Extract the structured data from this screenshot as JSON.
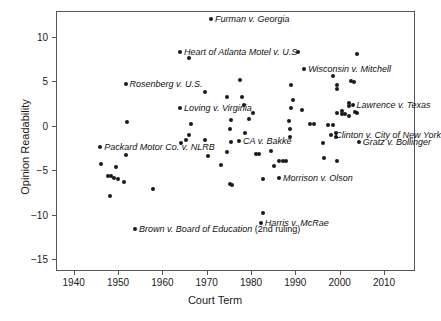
{
  "chart_data": {
    "type": "scatter",
    "title": "",
    "xlabel": "Court Term",
    "ylabel": "Opinion Readability",
    "xlim": [
      1936,
      2017
    ],
    "ylim": [
      -16.3,
      12.9
    ],
    "xticks": [
      1940,
      1950,
      1960,
      1970,
      1980,
      1990,
      2000,
      2010
    ],
    "xticklabels": [
      "1940",
      "1950",
      "1960",
      "1970",
      "1980",
      "1990",
      "2000",
      "2010"
    ],
    "yticks": [
      10,
      5,
      0,
      -5,
      -10,
      -15
    ],
    "yticklabels": [
      "10",
      "5",
      "0",
      "-5",
      "-10",
      "-15"
    ],
    "grid": false,
    "legend": null,
    "marker_color": "#1a1a1a",
    "frame_color": "#555555",
    "points": [
      {
        "x": 1971,
        "y": 12.0
      },
      {
        "x": 1964,
        "y": 8.3
      },
      {
        "x": 1966,
        "y": 7.6
      },
      {
        "x": 1990.5,
        "y": 8.3
      },
      {
        "x": 2004,
        "y": 8.1
      },
      {
        "x": 1992,
        "y": 6.4
      },
      {
        "x": 1951.7,
        "y": 4.75
      },
      {
        "x": 1977.5,
        "y": 5.15
      },
      {
        "x": 1998.6,
        "y": 5.6
      },
      {
        "x": 2002.5,
        "y": 5.0
      },
      {
        "x": 2003.2,
        "y": 4.95
      },
      {
        "x": 1999.3,
        "y": 4.6
      },
      {
        "x": 1999.3,
        "y": 4.2
      },
      {
        "x": 1989,
        "y": 4.6
      },
      {
        "x": 1969.5,
        "y": 3.8
      },
      {
        "x": 1974.5,
        "y": 3.2
      },
      {
        "x": 1978,
        "y": 3.3
      },
      {
        "x": 1989.5,
        "y": 2.9
      },
      {
        "x": 1964,
        "y": 2.05
      },
      {
        "x": 1978.3,
        "y": 2.35
      },
      {
        "x": 1989,
        "y": 2.0
      },
      {
        "x": 1991.5,
        "y": 1.8
      },
      {
        "x": 2002.2,
        "y": 2.55
      },
      {
        "x": 2002.2,
        "y": 2.25
      },
      {
        "x": 2002.9,
        "y": 2.4
      },
      {
        "x": 1980.5,
        "y": 1.5
      },
      {
        "x": 1979.5,
        "y": 0.75
      },
      {
        "x": 2000.5,
        "y": 1.7
      },
      {
        "x": 2000.5,
        "y": 1.35
      },
      {
        "x": 2001.3,
        "y": 1.35
      },
      {
        "x": 2002.0,
        "y": 1.15
      },
      {
        "x": 2003.4,
        "y": 1.6
      },
      {
        "x": 2003.8,
        "y": 1.45
      },
      {
        "x": 1999.3,
        "y": 1.4
      },
      {
        "x": 1975.5,
        "y": 0.7
      },
      {
        "x": 1988.5,
        "y": 0.6
      },
      {
        "x": 1952,
        "y": 0.45
      },
      {
        "x": 1966.5,
        "y": 0.2
      },
      {
        "x": 1993.3,
        "y": 0.2
      },
      {
        "x": 1994.2,
        "y": 0.25
      },
      {
        "x": 1997.3,
        "y": 0.05
      },
      {
        "x": 1998.6,
        "y": 0.05
      },
      {
        "x": 1975.3,
        "y": -0.3
      },
      {
        "x": 1988.8,
        "y": -0.4
      },
      {
        "x": 1978.6,
        "y": -0.85
      },
      {
        "x": 1966,
        "y": -1.05
      },
      {
        "x": 1999.2,
        "y": -0.85
      },
      {
        "x": 1999.2,
        "y": -1.2
      },
      {
        "x": 1998.1,
        "y": -1.05
      },
      {
        "x": 1988.7,
        "y": -1.25
      },
      {
        "x": 1946,
        "y": -2.35
      },
      {
        "x": 1964.2,
        "y": -1.9
      },
      {
        "x": 1965.3,
        "y": -1.6
      },
      {
        "x": 1969.6,
        "y": -1.55
      },
      {
        "x": 1977.3,
        "y": -1.65
      },
      {
        "x": 1975.5,
        "y": -1.85
      },
      {
        "x": 1996.2,
        "y": -1.95
      },
      {
        "x": 2004.3,
        "y": -1.85
      },
      {
        "x": 1951.8,
        "y": -3.3
      },
      {
        "x": 1970.2,
        "y": -3.4
      },
      {
        "x": 1974.5,
        "y": -2.95
      },
      {
        "x": 1981.2,
        "y": -3.15
      },
      {
        "x": 1981.8,
        "y": -3.2
      },
      {
        "x": 1984.5,
        "y": -2.85
      },
      {
        "x": 1996.4,
        "y": -3.6
      },
      {
        "x": 1999.3,
        "y": -3.9
      },
      {
        "x": 1946.2,
        "y": -4.3
      },
      {
        "x": 1949.6,
        "y": -4.6
      },
      {
        "x": 1973.2,
        "y": -4.4
      },
      {
        "x": 1985.2,
        "y": -4.45
      },
      {
        "x": 1986.4,
        "y": -3.95
      },
      {
        "x": 1987.3,
        "y": -3.9
      },
      {
        "x": 1987.8,
        "y": -3.95
      },
      {
        "x": 1947.8,
        "y": -5.6
      },
      {
        "x": 1948.3,
        "y": -5.6
      },
      {
        "x": 1949.1,
        "y": -5.9
      },
      {
        "x": 1950.0,
        "y": -5.95
      },
      {
        "x": 1951.3,
        "y": -6.35
      },
      {
        "x": 1957.8,
        "y": -7.05
      },
      {
        "x": 1948.1,
        "y": -7.85
      },
      {
        "x": 1975.2,
        "y": -6.55
      },
      {
        "x": 1975.8,
        "y": -6.6
      },
      {
        "x": 1982.8,
        "y": -6.0
      },
      {
        "x": 1986.3,
        "y": -5.9
      },
      {
        "x": 1982.7,
        "y": -9.75
      },
      {
        "x": 1982.2,
        "y": -10.85
      },
      {
        "x": 1953.8,
        "y": -11.6
      }
    ],
    "annotations": [
      {
        "text": "Furman v. Georgia",
        "x": 1971,
        "y": 12.0,
        "align": "left"
      },
      {
        "text": "Heart of Atlanta Motel v. U.S",
        "x": 1964,
        "y": 8.3,
        "align": "left"
      },
      {
        "text": "Wisconsin v. Mitchell",
        "x": 1992,
        "y": 6.4,
        "align": "left"
      },
      {
        "text": "Rosenberg v. U.S.",
        "x": 1951.7,
        "y": 4.75,
        "align": "left"
      },
      {
        "text": "Lawrence v. Texas",
        "x": 2002.9,
        "y": 2.4,
        "align": "left"
      },
      {
        "text": "Loving v. Virginia",
        "x": 1964,
        "y": 2.05,
        "align": "left"
      },
      {
        "text": "Clinton v. City of New York",
        "x": 1998.1,
        "y": -1.05,
        "align": "left"
      },
      {
        "text": "CA v. Bakke",
        "x": 1977.3,
        "y": -1.65,
        "align": "left"
      },
      {
        "text": "Gratz v. Bollinger",
        "x": 2004.3,
        "y": -1.85,
        "align": "left"
      },
      {
        "text": "Packard Motor Co. v. NLRB",
        "x": 1946,
        "y": -2.35,
        "align": "left"
      },
      {
        "text": "Morrison v. Olson",
        "x": 1986.3,
        "y": -5.9,
        "align": "left"
      },
      {
        "text": "Harris v. McRae",
        "x": 1982.2,
        "y": -10.85,
        "align": "left"
      },
      {
        "text": "Brown v. Board of Education ",
        "suffix": "(2nd ruling)",
        "x": 1953.8,
        "y": -11.6,
        "align": "left"
      }
    ]
  }
}
